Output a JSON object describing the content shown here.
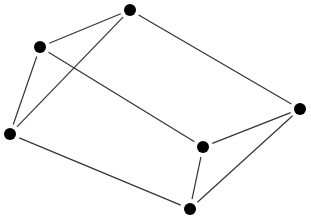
{
  "graph": {
    "background": "#ffffff",
    "node_color": "#000000",
    "edge_color": "#333333",
    "node_radius": 6,
    "nodes": [
      {
        "id": "A",
        "x": 130,
        "y": 10
      },
      {
        "id": "B",
        "x": 40,
        "y": 47
      },
      {
        "id": "C",
        "x": 10,
        "y": 134
      },
      {
        "id": "D",
        "x": 300,
        "y": 109
      },
      {
        "id": "E",
        "x": 203,
        "y": 147
      },
      {
        "id": "F",
        "x": 190,
        "y": 209
      }
    ],
    "edges": [
      [
        "A",
        "B"
      ],
      [
        "A",
        "C"
      ],
      [
        "A",
        "D"
      ],
      [
        "B",
        "C"
      ],
      [
        "B",
        "E"
      ],
      [
        "C",
        "F"
      ],
      [
        "E",
        "D"
      ],
      [
        "E",
        "F"
      ],
      [
        "D",
        "F"
      ]
    ]
  }
}
